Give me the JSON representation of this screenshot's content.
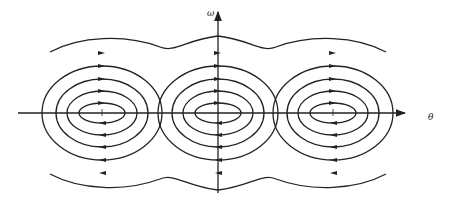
{
  "diagram": {
    "type": "phase-portrait",
    "axes": {
      "x_label": "θ",
      "y_label": "ω"
    },
    "centers_x": [
      102,
      218,
      333
    ],
    "axis_y": 113,
    "colors": {
      "stroke": "#222222",
      "background": "#ffffff"
    }
  }
}
